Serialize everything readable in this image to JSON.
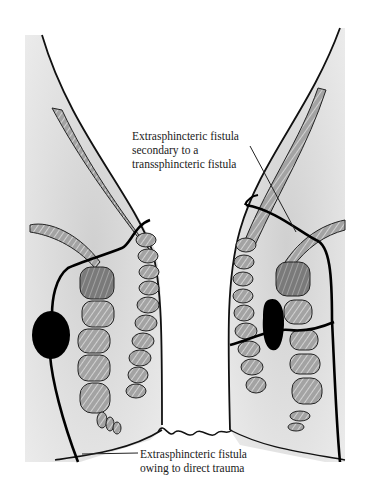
{
  "figure": {
    "colors": {
      "background": "#ffffff",
      "tissue_fill": "#e2e2e2",
      "muscle_fill": "#9a9a9a",
      "muscle_dark_fill": "#6e6e6e",
      "outline": "#111111",
      "abscess": "#000000"
    }
  },
  "labels": {
    "top": {
      "lines": [
        "Extrasphincteric fistula",
        "secondary to a",
        "transsphincteric fistula"
      ]
    },
    "bottom": {
      "lines": [
        "Extrasphincteric fistula",
        "owing to direct trauma"
      ]
    }
  }
}
